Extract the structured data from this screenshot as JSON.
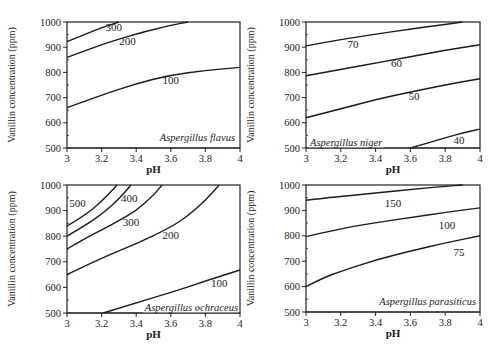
{
  "figure": {
    "ylabel": "Vanillin concentration (ppm)",
    "xlabel": "pH",
    "x_ticks": [
      "3",
      "3.2",
      "3.4",
      "3.6",
      "3.8",
      "4"
    ],
    "y_ticks": [
      "500",
      "600",
      "700",
      "800",
      "900",
      "1000"
    ]
  },
  "chart_data": [
    {
      "type": "line",
      "title": "Aspergillus flavus",
      "xlabel": "pH",
      "ylabel": "Vanillin concentration (ppm)",
      "xlim": [
        3,
        4
      ],
      "ylim": [
        500,
        1000
      ],
      "grid": false,
      "series": [
        {
          "name": "300",
          "x": [
            3.0,
            3.1,
            3.2,
            3.3
          ],
          "y": [
            922,
            950,
            978,
            1000
          ]
        },
        {
          "name": "200",
          "x": [
            3.0,
            3.1,
            3.2,
            3.3,
            3.4,
            3.5,
            3.6,
            3.7
          ],
          "y": [
            860,
            885,
            910,
            932,
            952,
            970,
            987,
            1000
          ]
        },
        {
          "name": "100",
          "x": [
            3.0,
            3.2,
            3.4,
            3.6,
            3.8,
            4.0
          ],
          "y": [
            660,
            710,
            755,
            790,
            808,
            820
          ]
        }
      ],
      "label_positions": [
        {
          "text": "300",
          "x": 3.27,
          "y": 965
        },
        {
          "text": "200",
          "x": 3.35,
          "y": 910
        },
        {
          "text": "100",
          "x": 3.6,
          "y": 755
        }
      ]
    },
    {
      "type": "line",
      "title": "Aspergillus niger",
      "xlabel": "pH",
      "ylabel": "Vanillin concentration (ppm)",
      "xlim": [
        3,
        4
      ],
      "ylim": [
        500,
        1000
      ],
      "grid": false,
      "series": [
        {
          "name": "70",
          "x": [
            3.0,
            3.2,
            3.4,
            3.6,
            3.8,
            3.9
          ],
          "y": [
            905,
            930,
            952,
            972,
            990,
            1000
          ]
        },
        {
          "name": "60",
          "x": [
            3.0,
            3.2,
            3.4,
            3.6,
            3.8,
            4.0
          ],
          "y": [
            787,
            812,
            837,
            862,
            888,
            910
          ]
        },
        {
          "name": "50",
          "x": [
            3.0,
            3.2,
            3.4,
            3.6,
            3.8,
            4.0
          ],
          "y": [
            620,
            655,
            692,
            722,
            750,
            775
          ]
        },
        {
          "name": "40",
          "x": [
            3.6,
            3.7,
            3.8,
            3.9,
            4.0
          ],
          "y": [
            500,
            520,
            540,
            560,
            575
          ]
        }
      ],
      "label_positions": [
        {
          "text": "70",
          "x": 3.27,
          "y": 895
        },
        {
          "text": "60",
          "x": 3.52,
          "y": 820
        },
        {
          "text": "50",
          "x": 3.62,
          "y": 690
        },
        {
          "text": "40",
          "x": 3.88,
          "y": 515
        }
      ]
    },
    {
      "type": "line",
      "title": "Aspergillus ochraceus",
      "xlabel": "pH",
      "ylabel": "Vanillin concentration (ppm)",
      "xlim": [
        3,
        4
      ],
      "ylim": [
        500,
        1000
      ],
      "grid": false,
      "series": [
        {
          "name": "500",
          "x": [
            3.0,
            3.1,
            3.2,
            3.29
          ],
          "y": [
            840,
            880,
            935,
            1000
          ]
        },
        {
          "name": "450",
          "x": [
            3.0,
            3.1,
            3.2,
            3.3,
            3.37
          ],
          "y": [
            800,
            840,
            885,
            945,
            1000
          ]
        },
        {
          "name": "400",
          "x": [
            3.0,
            3.1,
            3.2,
            3.3,
            3.4,
            3.5,
            3.55
          ],
          "y": [
            750,
            790,
            825,
            860,
            900,
            960,
            1000
          ]
        },
        {
          "name": "200",
          "x": [
            3.0,
            3.2,
            3.4,
            3.6,
            3.7,
            3.8,
            3.88
          ],
          "y": [
            650,
            715,
            770,
            835,
            880,
            940,
            1000
          ]
        },
        {
          "name": "100",
          "x": [
            3.21,
            3.4,
            3.6,
            3.8,
            4.0
          ],
          "y": [
            500,
            540,
            580,
            625,
            668
          ]
        }
      ],
      "label_positions": [
        {
          "text": "500",
          "x": 3.06,
          "y": 915
        },
        {
          "text": "400",
          "x": 3.36,
          "y": 935
        },
        {
          "text": "300",
          "x": 3.37,
          "y": 840
        },
        {
          "text": "200",
          "x": 3.6,
          "y": 790
        },
        {
          "text": "100",
          "x": 3.88,
          "y": 600
        }
      ],
      "note": "Contours appear in order 500, (unlabeled), 400/300 region, 200, 100 from top-left to bottom-right"
    },
    {
      "type": "line",
      "title": "Aspergillus parasiticus",
      "xlabel": "pH",
      "ylabel": "Vanillin concentration (ppm)",
      "xlim": [
        3,
        4
      ],
      "ylim": [
        500,
        1000
      ],
      "grid": false,
      "series": [
        {
          "name": "150",
          "x": [
            3.0,
            3.2,
            3.4,
            3.6,
            3.8,
            3.9
          ],
          "y": [
            940,
            955,
            968,
            982,
            995,
            1000
          ]
        },
        {
          "name": "100",
          "x": [
            3.0,
            3.2,
            3.4,
            3.6,
            3.8,
            4.0
          ],
          "y": [
            797,
            828,
            852,
            872,
            892,
            910
          ]
        },
        {
          "name": "75",
          "x": [
            3.0,
            3.1,
            3.2,
            3.4,
            3.6,
            3.8,
            4.0
          ],
          "y": [
            600,
            635,
            660,
            705,
            740,
            772,
            800
          ]
        }
      ],
      "label_positions": [
        {
          "text": "150",
          "x": 3.5,
          "y": 915
        },
        {
          "text": "100",
          "x": 3.81,
          "y": 825
        },
        {
          "text": "75",
          "x": 3.88,
          "y": 720
        }
      ]
    }
  ],
  "panels": [
    {
      "species": "Aspergillus  flavus",
      "box": {
        "x": 67,
        "y": 22,
        "w": 173,
        "h": 126
      },
      "species_pos": {
        "x": 235,
        "y": 141,
        "anchor": "end"
      }
    },
    {
      "species": "Aspergillus niger",
      "box": {
        "x": 306,
        "y": 22,
        "w": 174,
        "h": 126
      },
      "species_pos": {
        "x": 310,
        "y": 146,
        "anchor": "start"
      }
    },
    {
      "species": "Aspergillus ochraceus",
      "box": {
        "x": 67,
        "y": 185,
        "w": 173,
        "h": 128
      },
      "species_pos": {
        "x": 238,
        "y": 311,
        "anchor": "end"
      }
    },
    {
      "species": "Aspergillus parasiticus",
      "box": {
        "x": 306,
        "y": 185,
        "w": 174,
        "h": 127
      },
      "species_pos": {
        "x": 476,
        "y": 305,
        "anchor": "end"
      }
    }
  ]
}
